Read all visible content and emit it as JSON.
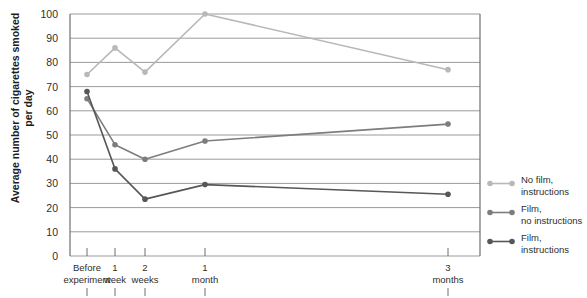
{
  "chart_data": {
    "type": "line",
    "title": "",
    "xlabel": "",
    "ylabel": "Average number of cigarettes\nsmoked per day",
    "categories": [
      "Before experiment",
      "1 week",
      "2 weeks",
      "1 month",
      "3 months"
    ],
    "category_lines": [
      [
        "Before",
        "experiment"
      ],
      [
        "1",
        "week"
      ],
      [
        "2",
        "weeks"
      ],
      [
        "1",
        "month"
      ],
      [
        "3",
        "months"
      ]
    ],
    "ylim": [
      0,
      100
    ],
    "yticks": [
      0,
      10,
      20,
      30,
      40,
      50,
      60,
      70,
      80,
      90,
      100
    ],
    "ytick_labels": [
      "0",
      "10",
      "20",
      "30",
      "40",
      "50",
      "60",
      "70",
      "80",
      "90",
      "100"
    ],
    "grid": true,
    "legend_position": "right",
    "series": [
      {
        "name": "No film,\ninstructions",
        "legend_label_lines": [
          "No film,",
          "instructions"
        ],
        "color": "#b8b8b8",
        "values": [
          75,
          86,
          76,
          100,
          77
        ]
      },
      {
        "name": "Film,\nno instructions",
        "legend_label_lines": [
          "Film,",
          "no instructions"
        ],
        "color": "#7d7d7d",
        "values": [
          65,
          46,
          40,
          47.5,
          54.5
        ]
      },
      {
        "name": "Film,\ninstructions",
        "legend_label_lines": [
          "Film,",
          "instructions"
        ],
        "color": "#575757",
        "values": [
          68,
          36,
          23.5,
          29.5,
          25.5
        ]
      }
    ]
  },
  "legend": {
    "entries": [
      {
        "label": "No film,\ninstructions",
        "color": "#b8b8b8"
      },
      {
        "label": "Film,\nno instructions",
        "color": "#7d7d7d"
      },
      {
        "label": "Film,\ninstructions",
        "color": "#575757"
      }
    ]
  },
  "axes": {
    "y_title": "Average number of cigarettes\nsmoked per day"
  },
  "colors": {
    "gridline": "#9a9a9a",
    "axis": "#6f6f6f",
    "text": "#2e2e2e",
    "background": "#ffffff"
  }
}
